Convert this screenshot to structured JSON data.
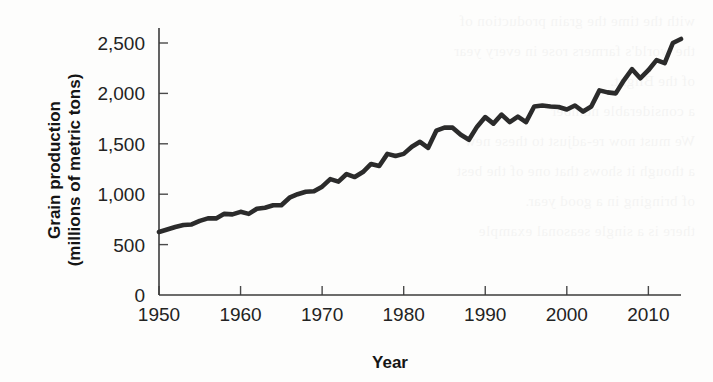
{
  "chart_data": {
    "type": "line",
    "title": "",
    "xlabel": "Year",
    "ylabel": "Grain production (millions of metric tons)",
    "ylabel_line1": "Grain production",
    "ylabel_line2": "(millions of metric tons)",
    "xlim": [
      1950,
      2014
    ],
    "ylim": [
      0,
      2700
    ],
    "grid": false,
    "legend": "none",
    "line_color": "#2b2b2b",
    "axis_color": "#3b3b3b",
    "xticks": [
      1950,
      1960,
      1970,
      1980,
      1990,
      2000,
      2010
    ],
    "xtick_labels": [
      "1950",
      "1960",
      "1970",
      "1980",
      "1990",
      "2000",
      "2010"
    ],
    "yticks": [
      0,
      500,
      1000,
      1500,
      2000,
      2500
    ],
    "ytick_labels": [
      "0",
      "500",
      "1,000",
      "1,500",
      "2,000",
      "2,500"
    ],
    "series": [
      {
        "name": "World grain production",
        "x": [
          1950,
          1951,
          1952,
          1953,
          1954,
          1955,
          1956,
          1957,
          1958,
          1959,
          1960,
          1961,
          1962,
          1963,
          1964,
          1965,
          1966,
          1967,
          1968,
          1969,
          1970,
          1971,
          1972,
          1973,
          1974,
          1975,
          1976,
          1977,
          1978,
          1979,
          1980,
          1981,
          1982,
          1983,
          1984,
          1985,
          1986,
          1987,
          1988,
          1989,
          1990,
          1991,
          1992,
          1993,
          1994,
          1995,
          1996,
          1997,
          1998,
          1999,
          2000,
          2001,
          2002,
          2003,
          2004,
          2005,
          2006,
          2007,
          2008,
          2009,
          2010,
          2011,
          2012,
          2013,
          2014
        ],
        "y": [
          625,
          650,
          675,
          695,
          700,
          735,
          760,
          760,
          805,
          800,
          825,
          805,
          855,
          865,
          890,
          890,
          965,
          1000,
          1025,
          1030,
          1075,
          1150,
          1125,
          1200,
          1170,
          1220,
          1300,
          1280,
          1400,
          1380,
          1400,
          1470,
          1520,
          1460,
          1630,
          1660,
          1660,
          1590,
          1540,
          1670,
          1765,
          1700,
          1790,
          1715,
          1770,
          1715,
          1870,
          1880,
          1870,
          1865,
          1840,
          1880,
          1820,
          1870,
          2030,
          2010,
          2000,
          2130,
          2240,
          2150,
          2230,
          2330,
          2300,
          2500,
          2540
        ]
      }
    ]
  },
  "ghost_text": {
    "lines": [
      "with the time the grain production of",
      "the world's farmers rose in every year",
      "of the Blight.",
      "",
      "a considerable number",
      "We must now re-adjust to these new",
      "a though it shows that one of the best",
      "of bringing in a good year.",
      "",
      "there is a single seasonal example"
    ]
  }
}
